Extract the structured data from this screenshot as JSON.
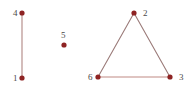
{
  "figure": {
    "type": "graph-diagram",
    "width": 195,
    "height": 93,
    "background_color": "#ffffff"
  },
  "chart_data": {
    "type": "diagram",
    "subtype": "undirected-graph",
    "title": "",
    "node_count": 6,
    "edge_count": 4,
    "node_color": "#8e2323",
    "node_radius": 2.6,
    "edge_color_horizontal": "#c08a84",
    "edge_color_diagonal": "#9a7a78",
    "edge_width": 1.1,
    "label_color": "#4a4a4a",
    "nodes": [
      {
        "id": "1",
        "label": "1",
        "x": 22,
        "y": 78,
        "label_x": 13,
        "label_y": 74,
        "label_anchor": "left"
      },
      {
        "id": "2",
        "label": "2",
        "x": 134,
        "y": 13,
        "label_x": 143,
        "label_y": 9,
        "label_anchor": "right"
      },
      {
        "id": "3",
        "label": "3",
        "x": 170,
        "y": 77,
        "label_x": 179,
        "label_y": 73,
        "label_anchor": "right"
      },
      {
        "id": "4",
        "label": "4",
        "x": 22,
        "y": 13,
        "label_x": 13,
        "label_y": 9,
        "label_anchor": "left"
      },
      {
        "id": "5",
        "label": "5",
        "x": 64,
        "y": 45,
        "label_x": 61,
        "label_y": 31,
        "label_anchor": "above"
      },
      {
        "id": "6",
        "label": "6",
        "x": 98,
        "y": 77,
        "label_x": 88,
        "label_y": 73,
        "label_anchor": "left"
      }
    ],
    "edges": [
      {
        "source": "4",
        "target": "1",
        "x1": 22,
        "y1": 13,
        "x2": 22,
        "y2": 78,
        "color": "#b08682"
      },
      {
        "source": "2",
        "target": "6",
        "x1": 134,
        "y1": 13,
        "x2": 98,
        "y2": 77,
        "color": "#9a7a78"
      },
      {
        "source": "2",
        "target": "3",
        "x1": 134,
        "y1": 13,
        "x2": 170,
        "y2": 77,
        "color": "#9a7a78"
      },
      {
        "source": "6",
        "target": "3",
        "x1": 98,
        "y1": 77,
        "x2": 170,
        "y2": 77,
        "color": "#c08a84"
      }
    ],
    "isolated_nodes": [
      "5"
    ],
    "components": [
      {
        "name": "edge-component",
        "members": [
          "1",
          "4"
        ]
      },
      {
        "name": "triangle-component",
        "members": [
          "2",
          "3",
          "6"
        ]
      },
      {
        "name": "singleton-component",
        "members": [
          "5"
        ]
      }
    ]
  }
}
